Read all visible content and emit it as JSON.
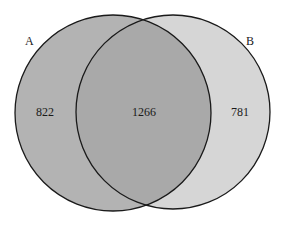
{
  "diagram": {
    "type": "venn",
    "sets": [
      {
        "name": "A",
        "only_count": "822",
        "fill": "#b4b4b4"
      },
      {
        "name": "B",
        "only_count": "781",
        "fill": "#d6d6d6"
      }
    ],
    "intersection": {
      "label": "A∩B",
      "count": "1266",
      "fill": "#a8a8a8"
    },
    "labels": {
      "set_a": "A",
      "set_b": "B",
      "a_only": "822",
      "both": "1266",
      "b_only": "781"
    }
  }
}
